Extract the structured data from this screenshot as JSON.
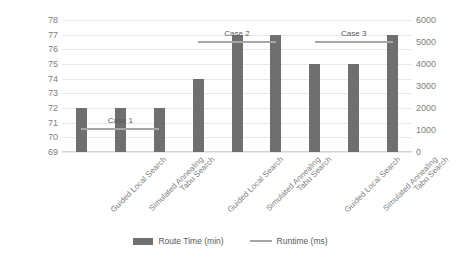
{
  "chart_data": {
    "type": "bar",
    "title": "",
    "xlabel": "",
    "ylabel": "",
    "grid": true,
    "legend_position": "bottom",
    "categories": [
      "Guided Local Search",
      "Simulated Annealing",
      "Tabu Search",
      "Guided Local Search",
      "Simulated Annealing",
      "Tabu Search",
      "Guided Local Search",
      "Simulated Annealing",
      "Tabu Search"
    ],
    "groups": [
      {
        "label": "Case 1",
        "categories": [
          "Guided Local Search",
          "Simulated Annealing",
          "Tabu Search"
        ],
        "route_time_min": [
          72,
          72,
          72
        ],
        "runtime_ms": [
          1100,
          1100,
          1100
        ]
      },
      {
        "label": "Case 2",
        "categories": [
          "Guided Local Search",
          "Simulated Annealing",
          "Tabu Search"
        ],
        "route_time_min": [
          74,
          77,
          77
        ],
        "runtime_ms": [
          5050,
          5050,
          5050
        ]
      },
      {
        "label": "Case 3",
        "categories": [
          "Guided Local Search",
          "Simulated Annealing",
          "Tabu Search"
        ],
        "route_time_min": [
          75,
          75,
          77
        ],
        "runtime_ms": [
          5050,
          5050,
          5050
        ]
      }
    ],
    "series": [
      {
        "name": "Route Time (min)",
        "type": "bar",
        "axis": "left",
        "color": "#6f6f6f",
        "values": [
          72,
          72,
          72,
          74,
          77,
          77,
          75,
          75,
          77
        ]
      },
      {
        "name": "Runtime (ms)",
        "type": "line",
        "axis": "right",
        "color": "#a6a6a6",
        "values": [
          1100,
          1100,
          1100,
          5050,
          5050,
          5050,
          5050,
          5050,
          5050
        ]
      }
    ],
    "y_axis_left": {
      "min": 69,
      "max": 78,
      "ticks": [
        69,
        70,
        71,
        72,
        73,
        74,
        75,
        76,
        77,
        78
      ]
    },
    "y_axis_right": {
      "min": 0,
      "max": 6000,
      "ticks": [
        0,
        1000,
        2000,
        3000,
        4000,
        5000,
        6000
      ]
    }
  },
  "legend": {
    "items": [
      {
        "label": "Route Time (min)",
        "marker": "bar-swatch",
        "color": "#6f6f6f"
      },
      {
        "label": "Runtime (ms)",
        "marker": "line-swatch",
        "color": "#a6a6a6"
      }
    ]
  },
  "axis_left_ticks": [
    "78",
    "77",
    "76",
    "75",
    "74",
    "73",
    "72",
    "71",
    "70",
    "69"
  ],
  "axis_right_ticks": [
    "6000",
    "5000",
    "4000",
    "3000",
    "2000",
    "1000",
    "0"
  ],
  "case_labels": [
    "Case 1",
    "Case 2",
    "Case 3"
  ],
  "category_labels": [
    "Guided Local Search",
    "Simulated Annealing",
    "Tabu Search",
    "Guided Local Search",
    "Simulated Annealing",
    "Tabu Search",
    "Guided Local Search",
    "Simulated Annealing",
    "Tabu Search"
  ]
}
